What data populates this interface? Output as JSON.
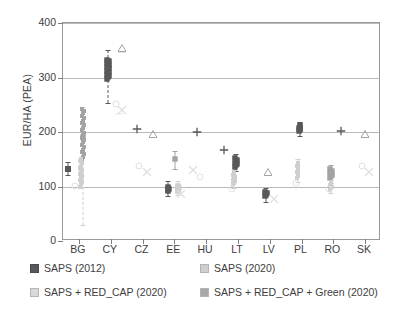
{
  "chart_data": {
    "type": "scatter",
    "title": "",
    "xlabel": "",
    "ylabel": "EUR/HA (PEA)",
    "ylim": [
      0,
      400
    ],
    "yticks": [
      0,
      100,
      200,
      300,
      400
    ],
    "grid": true,
    "legend_position": "below-axes",
    "categories": [
      "BG",
      "CY",
      "CZ",
      "EE",
      "HU",
      "LT",
      "LV",
      "PL",
      "RO",
      "SK"
    ],
    "series": [
      {
        "name": "SAPS (2012)",
        "marker": "filled-square-dark",
        "color": "#58585a",
        "values": [
          133,
          318,
          214,
          96,
          209,
          141,
          85,
          207,
          122,
          208
        ]
      },
      {
        "name": "SAPS (2020)",
        "marker": "light-square",
        "color": "#cfcfcf",
        "values": [
          101,
          248,
          136,
          98,
          138,
          107,
          86,
          137,
          98,
          137
        ]
      },
      {
        "name": "SAPS + RED_CAP (2020)",
        "marker": "x-square-light",
        "color": "#d7d7d7",
        "values": [
          191,
          251,
          137,
          94,
          137,
          130,
          86,
          136,
          99,
          136
        ]
      },
      {
        "name": "SAPS + RED_CAP + Green (2020)",
        "marker": "medium-square",
        "color": "#a3a3a3",
        "values": [
          186,
          305,
          137,
          97,
          137,
          136,
          86,
          137,
          100,
          137
        ]
      }
    ],
    "extra_markers": [
      {
        "category": "CY",
        "symbol": "triangle-open",
        "value": 365
      },
      {
        "category": "CY",
        "symbol": "dash",
        "value": 347
      },
      {
        "category": "CZ",
        "symbol": "plus",
        "value": 214
      },
      {
        "category": "CZ",
        "symbol": "triangle-open",
        "value": 208
      },
      {
        "category": "HU",
        "symbol": "plus",
        "value": 209
      },
      {
        "category": "LT",
        "symbol": "plus",
        "value": 177
      },
      {
        "category": "LV",
        "symbol": "triangle-open",
        "value": 138
      },
      {
        "category": "PL",
        "symbol": "plus",
        "value": 207
      },
      {
        "category": "RO",
        "symbol": "plus",
        "value": 211
      },
      {
        "category": "SK",
        "symbol": "triangle-open",
        "value": 208
      }
    ]
  },
  "axis": {
    "y_title": "EUR/HA (PEA)",
    "y_ticks": [
      "0",
      "100",
      "200",
      "300",
      "400"
    ],
    "x_ticks": [
      "BG",
      "CY",
      "CZ",
      "EE",
      "HU",
      "LT",
      "LV",
      "PL",
      "RO",
      "SK"
    ]
  },
  "legend": {
    "items": [
      {
        "label": "SAPS (2012)",
        "color": "#58585a"
      },
      {
        "label": "SAPS (2020)",
        "color": "#cfcfcf"
      },
      {
        "label": "SAPS + RED_CAP (2020)",
        "color": "#d9d9d9"
      },
      {
        "label": "SAPS + RED_CAP + Green (2020)",
        "color": "#a8a8a8"
      }
    ]
  },
  "colors": {
    "dark": "#58585a",
    "medium": "#a3a3a3",
    "light": "#cfcfcf",
    "lighter": "#e0e0e0",
    "grid": "#b9b9b9",
    "frame": "#9a9a9a",
    "text": "#3d3d3d"
  }
}
